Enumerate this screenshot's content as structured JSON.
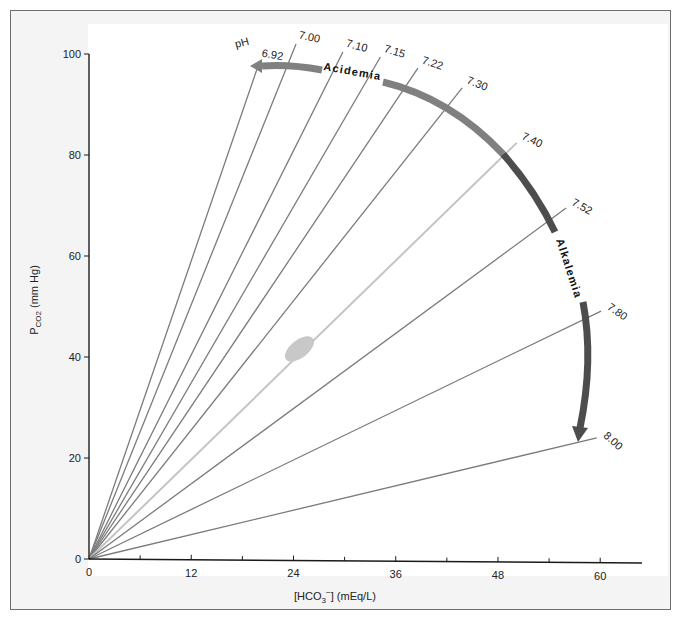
{
  "chart_data": {
    "type": "line",
    "title": "",
    "xlabel": "[HCO3−] (mEq/L)",
    "xlabel_parts": {
      "pre": "[HCO",
      "sub": "3",
      "sup": "−",
      "post": "] (mEq/L)"
    },
    "ylabel": "PCO2 (mm Hg)",
    "ylabel_parts": {
      "pre": "P",
      "sub": "CO2",
      "post": " (mm Hg)"
    },
    "xlim": [
      0,
      64
    ],
    "ylim": [
      0,
      100
    ],
    "x_ticks": [
      0,
      12,
      24,
      36,
      48,
      60
    ],
    "x_minor_ticks": [
      6,
      18,
      30,
      42,
      54
    ],
    "y_ticks": [
      0,
      20,
      40,
      60,
      80,
      100
    ],
    "grid": false,
    "ph_prefix": "pH",
    "series": [
      {
        "name": "6.92",
        "x": [
          0,
          20.0
        ],
        "y": [
          0,
          98.4
        ]
      },
      {
        "name": "7.00",
        "x": [
          0,
          24.3
        ],
        "y": [
          0,
          102
        ]
      },
      {
        "name": "7.10",
        "x": [
          0,
          29.8
        ],
        "y": [
          0,
          100.4
        ]
      },
      {
        "name": "7.15",
        "x": [
          0,
          34.2
        ],
        "y": [
          0,
          99.4
        ]
      },
      {
        "name": "7.22",
        "x": [
          0,
          38.6
        ],
        "y": [
          0,
          97.2
        ]
      },
      {
        "name": "7.30",
        "x": [
          0,
          43.8
        ],
        "y": [
          0,
          93.3
        ]
      },
      {
        "name": "7.40",
        "x": [
          0,
          50.2
        ],
        "y": [
          0,
          82.4
        ],
        "highlight": true
      },
      {
        "name": "7.52",
        "x": [
          0,
          56.0
        ],
        "y": [
          0,
          69.5
        ]
      },
      {
        "name": "7.80",
        "x": [
          0,
          60.1
        ],
        "y": [
          0,
          49.1
        ]
      },
      {
        "name": "8.00",
        "x": [
          0,
          59.6
        ],
        "y": [
          0,
          24.0
        ]
      }
    ],
    "annotations": [
      {
        "text": "Acidemia",
        "type": "arc-arrow",
        "direction": "toward lower pH",
        "color": "#7a7a7a"
      },
      {
        "text": "Alkalemia",
        "type": "arc-arrow",
        "direction": "toward higher pH",
        "color": "#4a4a4a"
      },
      {
        "text": "",
        "type": "ellipse",
        "center": [
          24,
          40
        ],
        "label": "normal point",
        "color": "#c8c8c8"
      }
    ]
  },
  "colors": {
    "line": "#7b7b7b",
    "normal_line": "#c4c4c4",
    "acidemia_arrow": "#808080",
    "alkalemia_arrow": "#4d4d4d",
    "axis": "#1a1a1a"
  }
}
